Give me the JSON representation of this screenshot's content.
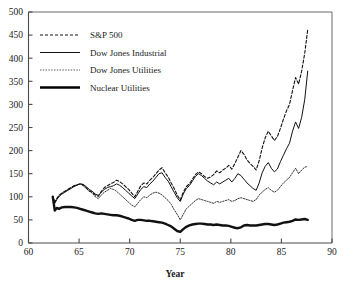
{
  "chart_data": {
    "type": "line",
    "title": "",
    "xlabel": "Year",
    "ylabel": "",
    "xlim": [
      60,
      90
    ],
    "ylim": [
      0,
      500
    ],
    "xticks": [
      60,
      65,
      70,
      75,
      80,
      85,
      90
    ],
    "yticks": [
      0,
      50,
      100,
      150,
      200,
      250,
      300,
      350,
      400,
      450,
      500
    ],
    "grid": false,
    "legend_position": "top-left",
    "note": "Index values rebased to 100 at early 1962; x values are two-digit years",
    "series": [
      {
        "name": "S&P 500",
        "style": "dashed",
        "color": "#111111",
        "linewidth": 1.1,
        "dasharray": "3,2",
        "x": [
          62.4,
          62.6,
          62.8,
          63.0,
          63.3,
          63.6,
          63.9,
          64.2,
          64.5,
          64.8,
          65.1,
          65.4,
          65.7,
          66.0,
          66.3,
          66.6,
          66.9,
          67.2,
          67.5,
          67.8,
          68.1,
          68.4,
          68.7,
          69.0,
          69.3,
          69.6,
          69.9,
          70.2,
          70.5,
          70.8,
          71.1,
          71.4,
          71.7,
          72.0,
          72.3,
          72.6,
          72.9,
          73.2,
          73.5,
          73.8,
          74.1,
          74.4,
          74.7,
          75.0,
          75.3,
          75.6,
          75.9,
          76.2,
          76.5,
          76.8,
          77.1,
          77.4,
          77.7,
          78.0,
          78.3,
          78.6,
          78.9,
          79.2,
          79.5,
          79.8,
          80.1,
          80.4,
          80.7,
          81.0,
          81.3,
          81.6,
          81.9,
          82.2,
          82.5,
          82.8,
          83.1,
          83.4,
          83.7,
          84.0,
          84.3,
          84.6,
          84.9,
          85.2,
          85.5,
          85.8,
          86.1,
          86.4,
          86.7,
          87.0,
          87.3,
          87.6
        ],
        "y": [
          100,
          88,
          96,
          103,
          108,
          112,
          116,
          120,
          124,
          126,
          128,
          126,
          120,
          113,
          110,
          104,
          101,
          112,
          120,
          124,
          128,
          131,
          136,
          133,
          128,
          122,
          116,
          108,
          100,
          112,
          124,
          130,
          128,
          136,
          142,
          150,
          158,
          163,
          152,
          143,
          130,
          118,
          104,
          93,
          110,
          122,
          128,
          138,
          148,
          154,
          150,
          144,
          140,
          143,
          148,
          156,
          152,
          158,
          162,
          168,
          160,
          172,
          186,
          200,
          192,
          180,
          172,
          166,
          158,
          178,
          206,
          228,
          242,
          232,
          222,
          230,
          248,
          268,
          286,
          300,
          330,
          358,
          344,
          372,
          410,
          462
        ]
      },
      {
        "name": "Dow Jones Industrial",
        "style": "solid-thin",
        "color": "#111111",
        "linewidth": 1.0,
        "dasharray": "",
        "x": [
          62.4,
          62.6,
          62.8,
          63.0,
          63.3,
          63.6,
          63.9,
          64.2,
          64.5,
          64.8,
          65.1,
          65.4,
          65.7,
          66.0,
          66.3,
          66.6,
          66.9,
          67.2,
          67.5,
          67.8,
          68.1,
          68.4,
          68.7,
          69.0,
          69.3,
          69.6,
          69.9,
          70.2,
          70.5,
          70.8,
          71.1,
          71.4,
          71.7,
          72.0,
          72.3,
          72.6,
          72.9,
          73.2,
          73.5,
          73.8,
          74.1,
          74.4,
          74.7,
          75.0,
          75.3,
          75.6,
          75.9,
          76.2,
          76.5,
          76.8,
          77.1,
          77.4,
          77.7,
          78.0,
          78.3,
          78.6,
          78.9,
          79.2,
          79.5,
          79.8,
          80.1,
          80.4,
          80.7,
          81.0,
          81.3,
          81.6,
          81.9,
          82.2,
          82.5,
          82.8,
          83.1,
          83.4,
          83.7,
          84.0,
          84.3,
          84.6,
          84.9,
          85.2,
          85.5,
          85.8,
          86.1,
          86.4,
          86.7,
          87.0,
          87.3,
          87.6
        ],
        "y": [
          100,
          86,
          94,
          100,
          106,
          110,
          114,
          118,
          122,
          125,
          128,
          127,
          122,
          116,
          112,
          106,
          103,
          110,
          116,
          120,
          122,
          124,
          128,
          125,
          120,
          114,
          108,
          102,
          96,
          106,
          116,
          122,
          120,
          128,
          134,
          142,
          150,
          152,
          142,
          134,
          122,
          110,
          98,
          90,
          106,
          118,
          124,
          134,
          144,
          150,
          146,
          140,
          134,
          130,
          126,
          132,
          128,
          132,
          136,
          140,
          132,
          140,
          150,
          146,
          138,
          130,
          124,
          118,
          114,
          130,
          152,
          166,
          174,
          162,
          154,
          160,
          176,
          190,
          204,
          216,
          242,
          262,
          248,
          272,
          310,
          372
        ]
      },
      {
        "name": "Dow Jones Utilities",
        "style": "dotted",
        "color": "#333333",
        "linewidth": 0.85,
        "dasharray": "1.4,1.4",
        "x": [
          62.4,
          62.6,
          62.8,
          63.0,
          63.3,
          63.6,
          63.9,
          64.2,
          64.5,
          64.8,
          65.1,
          65.4,
          65.7,
          66.0,
          66.3,
          66.6,
          66.9,
          67.2,
          67.5,
          67.8,
          68.1,
          68.4,
          68.7,
          69.0,
          69.3,
          69.6,
          69.9,
          70.2,
          70.5,
          70.8,
          71.1,
          71.4,
          71.7,
          72.0,
          72.3,
          72.6,
          72.9,
          73.2,
          73.5,
          73.8,
          74.1,
          74.4,
          74.7,
          75.0,
          75.3,
          75.6,
          75.9,
          76.2,
          76.5,
          76.8,
          77.1,
          77.4,
          77.7,
          78.0,
          78.3,
          78.6,
          78.9,
          79.2,
          79.5,
          79.8,
          80.1,
          80.4,
          80.7,
          81.0,
          81.3,
          81.6,
          81.9,
          82.2,
          82.5,
          82.8,
          83.1,
          83.4,
          83.7,
          84.0,
          84.3,
          84.6,
          84.9,
          85.2,
          85.5,
          85.8,
          86.1,
          86.4,
          86.7,
          87.0,
          87.3,
          87.6
        ],
        "y": [
          100,
          90,
          96,
          102,
          108,
          112,
          116,
          120,
          124,
          126,
          128,
          124,
          118,
          112,
          108,
          100,
          96,
          104,
          110,
          114,
          118,
          116,
          112,
          106,
          100,
          94,
          88,
          82,
          78,
          86,
          94,
          100,
          98,
          104,
          108,
          110,
          108,
          104,
          98,
          92,
          84,
          72,
          62,
          50,
          62,
          74,
          80,
          86,
          92,
          96,
          94,
          92,
          90,
          88,
          86,
          90,
          88,
          90,
          92,
          94,
          90,
          92,
          96,
          98,
          96,
          94,
          92,
          90,
          94,
          104,
          110,
          116,
          120,
          114,
          110,
          114,
          122,
          130,
          136,
          142,
          152,
          162,
          150,
          158,
          164,
          166
        ]
      },
      {
        "name": "Nuclear Utilities",
        "style": "solid-thick",
        "color": "#000000",
        "linewidth": 2.4,
        "dasharray": "",
        "x": [
          62.4,
          62.6,
          62.8,
          63.0,
          63.3,
          63.6,
          63.9,
          64.2,
          64.5,
          64.8,
          65.1,
          65.4,
          65.7,
          66.0,
          66.3,
          66.6,
          66.9,
          67.2,
          67.5,
          67.8,
          68.1,
          68.4,
          68.7,
          69.0,
          69.3,
          69.6,
          69.9,
          70.2,
          70.5,
          70.8,
          71.1,
          71.4,
          71.7,
          72.0,
          72.3,
          72.6,
          72.9,
          73.2,
          73.5,
          73.8,
          74.1,
          74.4,
          74.7,
          75.0,
          75.3,
          75.6,
          75.9,
          76.2,
          76.5,
          76.8,
          77.1,
          77.4,
          77.7,
          78.0,
          78.3,
          78.6,
          78.9,
          79.2,
          79.5,
          79.8,
          80.1,
          80.4,
          80.7,
          81.0,
          81.3,
          81.6,
          81.9,
          82.2,
          82.5,
          82.8,
          83.1,
          83.4,
          83.7,
          84.0,
          84.3,
          84.6,
          84.9,
          85.2,
          85.5,
          85.8,
          86.1,
          86.4,
          86.7,
          87.0,
          87.3,
          87.6
        ],
        "y": [
          100,
          70,
          76,
          74,
          77,
          78,
          78,
          78,
          77,
          76,
          74,
          72,
          70,
          68,
          66,
          64,
          63,
          64,
          63,
          62,
          61,
          60,
          60,
          59,
          57,
          55,
          53,
          50,
          48,
          50,
          50,
          49,
          48,
          48,
          47,
          46,
          45,
          44,
          42,
          39,
          36,
          31,
          26,
          24,
          30,
          35,
          38,
          40,
          41,
          42,
          42,
          41,
          40,
          40,
          39,
          40,
          39,
          38,
          38,
          37,
          35,
          33,
          32,
          34,
          38,
          39,
          38,
          38,
          38,
          39,
          40,
          41,
          41,
          40,
          39,
          40,
          42,
          44,
          45,
          46,
          48,
          51,
          50,
          51,
          52,
          50
        ]
      }
    ]
  },
  "legend": {
    "items": [
      {
        "label": "S&P 500"
      },
      {
        "label": "Dow Jones Industrial"
      },
      {
        "label": "Dow Jones Utilities"
      },
      {
        "label": "Nuclear Utilities"
      }
    ]
  },
  "axes": {
    "x_title": "Year",
    "x_tick_labels": [
      "60",
      "65",
      "70",
      "75",
      "80",
      "85",
      "90"
    ],
    "y_tick_labels": [
      "0",
      "50",
      "100",
      "150",
      "200",
      "250",
      "300",
      "350",
      "400",
      "450",
      "500"
    ]
  }
}
